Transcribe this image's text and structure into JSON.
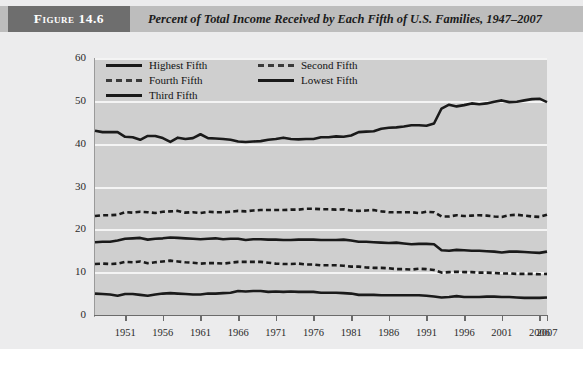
{
  "figure": {
    "tag": "Figure 14.6",
    "title": "Percent of Total Income Received by Each Fifth of U.S. Families, 1947–2007"
  },
  "colors": {
    "tag_bg": "#6e6e6e",
    "header_bg": "#bdbdbd",
    "panel_bg": "#ececed",
    "plot_bg": "#cfcfcf",
    "gridline": "#f4f4f4",
    "line": "#1a1a1a"
  },
  "legend": {
    "position": "top-left-inside-plot",
    "entries": [
      {
        "label": "Highest Fifth",
        "style": "solid",
        "col": 0,
        "row": 0
      },
      {
        "label": "Second Fifth",
        "style": "dashed",
        "col": 1,
        "row": 0
      },
      {
        "label": "Fourth Fifth",
        "style": "dashed",
        "col": 0,
        "row": 1
      },
      {
        "label": "Lowest Fifth",
        "style": "solid",
        "col": 1,
        "row": 1
      },
      {
        "label": "Third Fifth",
        "style": "solid",
        "col": 0,
        "row": 2
      }
    ]
  },
  "chart_data": {
    "type": "line",
    "title": "Percent of Total Income Received by Each Fifth of U.S. Families, 1947–2007",
    "xlabel": "",
    "ylabel": "",
    "xlim": [
      1947,
      2007
    ],
    "ylim": [
      0,
      60
    ],
    "yticks": [
      0,
      10,
      20,
      30,
      40,
      50,
      60
    ],
    "ytick_labels": [
      "0",
      "10",
      "20",
      "30",
      "40",
      "50",
      "60"
    ],
    "xticks": [
      1951,
      1956,
      1961,
      1966,
      1971,
      1976,
      1981,
      1986,
      1991,
      1996,
      2001,
      2006,
      2007
    ],
    "xtick_labels": [
      "1951",
      "1956",
      "1961",
      "1966",
      "1971",
      "1976",
      "1981",
      "1986",
      "1991",
      "1996",
      "2001",
      "2006",
      "2007"
    ],
    "grid": "horizontal",
    "x": [
      1947,
      1948,
      1949,
      1950,
      1951,
      1952,
      1953,
      1954,
      1955,
      1956,
      1957,
      1958,
      1959,
      1960,
      1961,
      1962,
      1963,
      1964,
      1965,
      1966,
      1967,
      1968,
      1969,
      1970,
      1971,
      1972,
      1973,
      1974,
      1975,
      1976,
      1977,
      1978,
      1979,
      1980,
      1981,
      1982,
      1983,
      1984,
      1985,
      1986,
      1987,
      1988,
      1989,
      1990,
      1991,
      1992,
      1993,
      1994,
      1995,
      1996,
      1997,
      1998,
      1999,
      2000,
      2001,
      2002,
      2003,
      2004,
      2005,
      2006,
      2007
    ],
    "series": [
      {
        "name": "Highest Fifth",
        "style": "solid",
        "values": [
          43.0,
          42.7,
          42.7,
          42.7,
          41.6,
          41.5,
          40.9,
          41.8,
          41.8,
          41.3,
          40.4,
          41.4,
          41.1,
          41.3,
          42.2,
          41.3,
          41.2,
          41.1,
          40.9,
          40.5,
          40.4,
          40.5,
          40.6,
          40.9,
          41.1,
          41.4,
          41.1,
          41.0,
          41.1,
          41.1,
          41.5,
          41.5,
          41.7,
          41.6,
          41.9,
          42.7,
          42.8,
          42.9,
          43.5,
          43.7,
          43.8,
          44.0,
          44.3,
          44.3,
          44.2,
          44.7,
          48.2,
          49.1,
          48.7,
          49.0,
          49.4,
          49.2,
          49.4,
          49.8,
          50.1,
          49.7,
          49.8,
          50.1,
          50.4,
          50.5,
          49.7
        ]
      },
      {
        "name": "Second Fifth",
        "style": "dashed",
        "values": [
          23.1,
          23.3,
          23.3,
          23.4,
          24.0,
          23.9,
          24.1,
          24.0,
          23.8,
          24.1,
          24.2,
          24.3,
          23.9,
          24.0,
          23.8,
          24.1,
          24.0,
          24.0,
          24.1,
          24.3,
          24.2,
          24.4,
          24.5,
          24.5,
          24.5,
          24.5,
          24.6,
          24.6,
          24.8,
          24.8,
          24.7,
          24.7,
          24.6,
          24.7,
          24.4,
          24.3,
          24.4,
          24.5,
          24.2,
          24.0,
          24.0,
          24.0,
          24.0,
          23.8,
          24.1,
          24.0,
          23.0,
          23.0,
          23.3,
          23.1,
          23.2,
          23.3,
          23.2,
          23.0,
          22.9,
          23.3,
          23.4,
          23.2,
          23.0,
          22.9,
          23.4
        ]
      },
      {
        "name": "Third Fifth",
        "style": "solid",
        "values": [
          17.0,
          17.1,
          17.1,
          17.4,
          17.8,
          17.9,
          18.0,
          17.6,
          17.8,
          17.9,
          18.1,
          18.0,
          17.9,
          17.8,
          17.7,
          17.8,
          17.9,
          17.7,
          17.8,
          17.8,
          17.5,
          17.7,
          17.7,
          17.6,
          17.6,
          17.5,
          17.5,
          17.6,
          17.6,
          17.6,
          17.5,
          17.5,
          17.5,
          17.6,
          17.4,
          17.1,
          17.1,
          17.0,
          16.9,
          16.8,
          16.9,
          16.7,
          16.5,
          16.6,
          16.6,
          16.5,
          15.1,
          15.0,
          15.2,
          15.1,
          15.0,
          15.0,
          14.9,
          14.8,
          14.6,
          14.8,
          14.8,
          14.7,
          14.6,
          14.5,
          14.8
        ]
      },
      {
        "name": "Fourth Fifth",
        "style": "dashed",
        "values": [
          11.9,
          12.0,
          11.9,
          12.0,
          12.4,
          12.3,
          12.5,
          12.1,
          12.3,
          12.5,
          12.7,
          12.5,
          12.3,
          12.2,
          12.0,
          12.1,
          12.1,
          12.0,
          12.2,
          12.4,
          12.4,
          12.4,
          12.4,
          12.2,
          12.0,
          11.9,
          11.9,
          12.0,
          11.8,
          11.8,
          11.6,
          11.6,
          11.6,
          11.5,
          11.3,
          11.3,
          11.1,
          11.0,
          11.0,
          10.9,
          10.7,
          10.7,
          10.6,
          10.8,
          10.7,
          10.5,
          9.9,
          10.0,
          10.1,
          10.0,
          10.0,
          9.9,
          9.9,
          9.8,
          9.7,
          9.7,
          9.6,
          9.6,
          9.6,
          9.5,
          9.6
        ]
      },
      {
        "name": "Lowest Fifth",
        "style": "solid",
        "values": [
          5.0,
          4.9,
          4.8,
          4.5,
          4.9,
          4.9,
          4.7,
          4.5,
          4.8,
          5.0,
          5.1,
          5.0,
          4.9,
          4.8,
          4.8,
          5.0,
          5.0,
          5.1,
          5.2,
          5.6,
          5.5,
          5.6,
          5.6,
          5.4,
          5.5,
          5.4,
          5.5,
          5.4,
          5.4,
          5.4,
          5.2,
          5.2,
          5.2,
          5.1,
          5.0,
          4.7,
          4.7,
          4.7,
          4.6,
          4.6,
          4.6,
          4.6,
          4.6,
          4.6,
          4.5,
          4.3,
          4.1,
          4.2,
          4.4,
          4.2,
          4.2,
          4.2,
          4.3,
          4.3,
          4.2,
          4.2,
          4.1,
          4.0,
          4.0,
          4.0,
          4.1
        ]
      }
    ]
  }
}
